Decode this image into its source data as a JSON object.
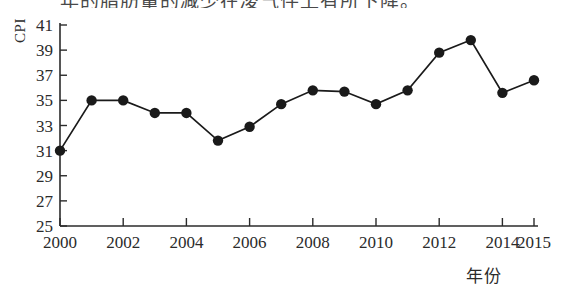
{
  "page": {
    "scan_top_text": "年的脂肪量的减少在凌气件上有所下降。"
  },
  "figure": {
    "y_axis_title": "CPI",
    "x_axis_title": "年份"
  },
  "chart_data": {
    "type": "line",
    "title": "",
    "subtitle": "",
    "xlabel": "年份",
    "ylabel": "CPI",
    "x": [
      2000,
      2001,
      2002,
      2003,
      2004,
      2005,
      2006,
      2007,
      2008,
      2009,
      2010,
      2011,
      2012,
      2013,
      2014,
      2015
    ],
    "values": [
      31.0,
      35.0,
      35.0,
      34.0,
      34.0,
      31.8,
      32.9,
      34.7,
      35.8,
      35.7,
      34.7,
      35.8,
      38.8,
      39.8,
      35.6,
      36.6
    ],
    "series": [
      {
        "name": "CPI",
        "values": [
          31.0,
          35.0,
          35.0,
          34.0,
          34.0,
          31.8,
          32.9,
          34.7,
          35.8,
          35.7,
          34.7,
          35.8,
          38.8,
          39.8,
          35.6,
          36.6
        ]
      }
    ],
    "xlim": [
      2000,
      2015
    ],
    "ylim": [
      25,
      41
    ],
    "ytick_labels": [
      "25",
      "27",
      "29",
      "31",
      "33",
      "35",
      "37",
      "39",
      "41"
    ],
    "ytick_values": [
      25,
      27,
      29,
      31,
      33,
      35,
      37,
      39,
      41
    ],
    "xtick_labels": [
      "2000",
      "2002",
      "2004",
      "2006",
      "2008",
      "2010",
      "2012",
      "2014",
      "2015"
    ],
    "xtick_values": [
      2000,
      2002,
      2004,
      2006,
      2008,
      2010,
      2012,
      2014,
      2015
    ],
    "grid": false,
    "legend": "none",
    "marker": "filled-circle",
    "marker_color": "#1a1a1a",
    "line_color": "#1a1a1a",
    "axis_color": "#2b2b2b"
  }
}
